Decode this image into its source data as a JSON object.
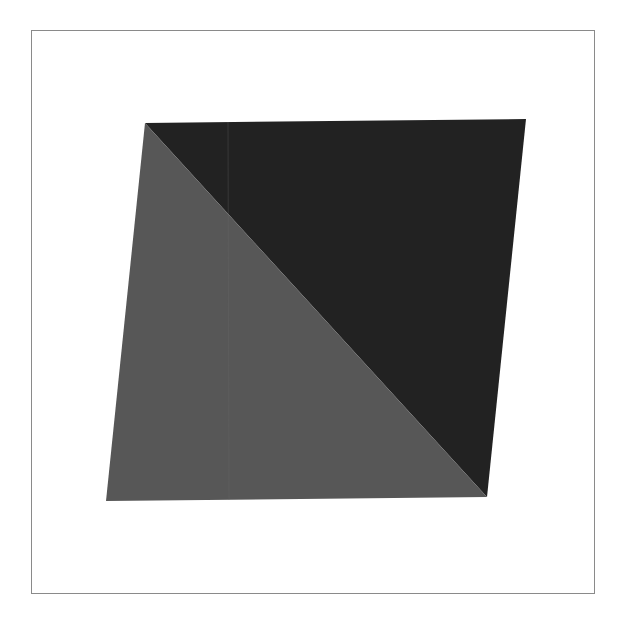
{
  "artwork": {
    "background": "#ffffff",
    "frame_color": "#8a8a8a",
    "shape": "parallelogram",
    "vertices": {
      "top_left": [
        145,
        123
      ],
      "top_right": [
        526,
        119
      ],
      "bottom_right": [
        487,
        497
      ],
      "bottom_left": [
        106,
        501
      ]
    },
    "upper_triangle_color": "#222222",
    "lower_triangle_color": "#575757"
  }
}
